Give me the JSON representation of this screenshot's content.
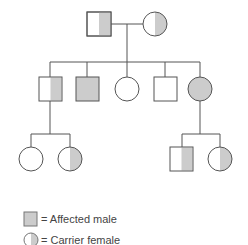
{
  "diagram": {
    "type": "pedigree",
    "colors": {
      "line": "#555555",
      "fill_affected": "#cccccc",
      "fill_normal": "#ffffff"
    },
    "generations": [
      {
        "label": "Generation I",
        "individuals": [
          {
            "id": "I-1",
            "sex": "male",
            "status": "half-shaded"
          },
          {
            "id": "I-2",
            "sex": "female",
            "status": "carrier"
          }
        ]
      },
      {
        "label": "Generation II",
        "individuals": [
          {
            "id": "II-1",
            "sex": "male",
            "status": "half-shaded"
          },
          {
            "id": "II-2",
            "sex": "male",
            "status": "affected"
          },
          {
            "id": "II-3",
            "sex": "female",
            "status": "unaffected"
          },
          {
            "id": "II-4",
            "sex": "male",
            "status": "unaffected"
          },
          {
            "id": "II-5",
            "sex": "female",
            "status": "affected"
          }
        ]
      },
      {
        "label": "Generation III",
        "individuals": [
          {
            "id": "III-1",
            "sex": "female",
            "status": "unaffected",
            "parent": "II-1"
          },
          {
            "id": "III-2",
            "sex": "female",
            "status": "carrier",
            "parent": "II-1"
          },
          {
            "id": "III-3",
            "sex": "male",
            "status": "half-shaded",
            "parent": "II-5"
          },
          {
            "id": "III-4",
            "sex": "female",
            "status": "carrier",
            "parent": "II-5"
          }
        ]
      }
    ]
  },
  "legend": {
    "items": [
      {
        "symbol": "shaded-square",
        "label": "= Affected male"
      },
      {
        "symbol": "half-shaded-circle",
        "label": "= Carrier female"
      }
    ]
  }
}
